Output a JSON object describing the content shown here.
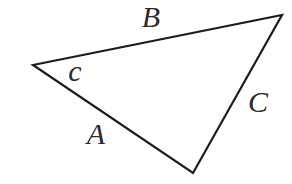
{
  "diagram": {
    "background": "#ffffff",
    "line_color": "#1c1c1c",
    "line_width": 2.2,
    "label_color": "#2b2b2b",
    "vertices": [
      {
        "name": "left",
        "x": 33,
        "y": 65
      },
      {
        "name": "top-right",
        "x": 282,
        "y": 15
      },
      {
        "name": "bottom",
        "x": 193,
        "y": 173
      }
    ],
    "labels": [
      {
        "id": "side-b",
        "text": "B",
        "x": 151,
        "y": 16
      },
      {
        "id": "angle-c",
        "text": "c",
        "x": 75,
        "y": 70
      },
      {
        "id": "side-c",
        "text": "C",
        "x": 258,
        "y": 101
      },
      {
        "id": "side-a",
        "text": "A",
        "x": 96,
        "y": 133
      }
    ]
  }
}
